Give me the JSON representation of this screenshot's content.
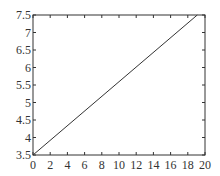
{
  "chart_data": {
    "type": "line",
    "title": "",
    "xlabel": "",
    "ylabel": "",
    "xlim": [
      0,
      20
    ],
    "ylim": [
      3.5,
      7.5
    ],
    "grid": false,
    "legend": null,
    "x_ticks": [
      0,
      2,
      4,
      6,
      8,
      10,
      12,
      14,
      16,
      18,
      20
    ],
    "x_tick_labels": [
      "0",
      "2",
      "4",
      "6",
      "8",
      "10",
      "12",
      "14",
      "16",
      "18",
      "20"
    ],
    "y_ticks": [
      3.5,
      4,
      4.5,
      5,
      5.5,
      6,
      6.5,
      7,
      7.5
    ],
    "y_tick_labels": [
      "3.5",
      "4",
      "4.5",
      "5",
      "5.5",
      "6",
      "6.5",
      "7",
      "7.5"
    ],
    "series": [
      {
        "name": "line",
        "color": "#333333",
        "x": [
          0,
          19.1
        ],
        "y": [
          3.5,
          7.5
        ]
      }
    ]
  },
  "style": {
    "axis_color": "#333333",
    "line_color": "#333333",
    "background": "#ffffff"
  }
}
